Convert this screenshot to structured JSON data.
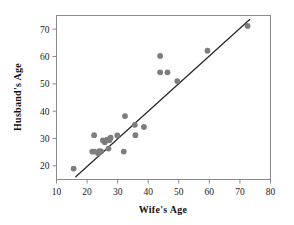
{
  "chart_data": {
    "type": "scatter",
    "title": "",
    "xlabel": "Wife's Age",
    "ylabel": "Husband's Age",
    "xlim": [
      10,
      80
    ],
    "ylim": [
      15,
      75
    ],
    "xticks": [
      10,
      20,
      30,
      40,
      50,
      60,
      70,
      80
    ],
    "yticks": [
      20,
      30,
      40,
      50,
      60,
      70
    ],
    "xtick_labels": [
      "10",
      "20",
      "30",
      "40",
      "50",
      "60",
      "70",
      "80"
    ],
    "ytick_labels": [
      "20",
      "30",
      "40",
      "50",
      "60",
      "70"
    ],
    "grid": false,
    "legend": null,
    "marker_color": "#7d7d7d",
    "line_color": "#2a2a2a",
    "frame_color": "#8a8a8a",
    "points": [
      {
        "x": 15.6,
        "y": 19.0
      },
      {
        "x": 21.7,
        "y": 25.2
      },
      {
        "x": 22.4,
        "y": 25.2
      },
      {
        "x": 22.3,
        "y": 31.2
      },
      {
        "x": 23.6,
        "y": 24.6
      },
      {
        "x": 24.0,
        "y": 25.4
      },
      {
        "x": 24.6,
        "y": 25.3
      },
      {
        "x": 25.2,
        "y": 29.3
      },
      {
        "x": 25.8,
        "y": 28.6
      },
      {
        "x": 26.6,
        "y": 29.6
      },
      {
        "x": 27.0,
        "y": 26.3
      },
      {
        "x": 27.3,
        "y": 29.4
      },
      {
        "x": 27.7,
        "y": 30.3
      },
      {
        "x": 29.9,
        "y": 31.1
      },
      {
        "x": 32.0,
        "y": 25.2
      },
      {
        "x": 32.4,
        "y": 38.2
      },
      {
        "x": 35.6,
        "y": 35.0
      },
      {
        "x": 35.8,
        "y": 31.2
      },
      {
        "x": 38.6,
        "y": 34.2
      },
      {
        "x": 43.9,
        "y": 60.2
      },
      {
        "x": 43.9,
        "y": 54.2
      },
      {
        "x": 46.3,
        "y": 54.2
      },
      {
        "x": 49.5,
        "y": 51.0
      },
      {
        "x": 59.4,
        "y": 62.1
      },
      {
        "x": 72.5,
        "y": 71.2
      }
    ],
    "fit_line": {
      "type": "linear",
      "x_start": 16.3,
      "y_start": 16.0,
      "x_end": 73.2,
      "y_end": 73.5
    }
  }
}
